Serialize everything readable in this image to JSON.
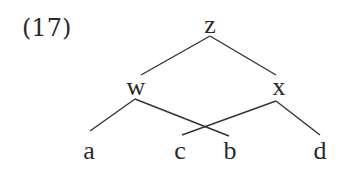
{
  "example_number": "(17)",
  "tree": {
    "root": "z",
    "nodes": [
      {
        "id": "z",
        "label": "z",
        "x": 210,
        "y": 12
      },
      {
        "id": "w",
        "label": "w",
        "x": 136,
        "y": 74
      },
      {
        "id": "x",
        "label": "x",
        "x": 279,
        "y": 74
      },
      {
        "id": "a",
        "label": "a",
        "x": 89,
        "y": 138
      },
      {
        "id": "c",
        "label": "c",
        "x": 180,
        "y": 138
      },
      {
        "id": "b",
        "label": "b",
        "x": 230,
        "y": 138
      },
      {
        "id": "d",
        "label": "d",
        "x": 320,
        "y": 138
      }
    ],
    "edges": [
      {
        "from": "z",
        "to": "w"
      },
      {
        "from": "z",
        "to": "x"
      },
      {
        "from": "w",
        "to": "a"
      },
      {
        "from": "w",
        "to": "b"
      },
      {
        "from": "x",
        "to": "c"
      },
      {
        "from": "x",
        "to": "d"
      }
    ],
    "line_color": "#333333"
  }
}
